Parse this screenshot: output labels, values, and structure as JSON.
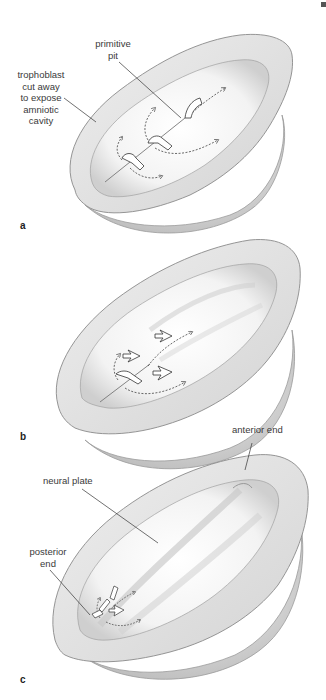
{
  "figure": {
    "panels": [
      {
        "id": "a",
        "label": "a",
        "annotations": [
          {
            "key": "trophoblast",
            "lines": [
              "trophoblast",
              "cut away",
              "to expose",
              "amniotic",
              "cavity"
            ]
          },
          {
            "key": "primitive_pit",
            "lines": [
              "primitive",
              "pit"
            ]
          }
        ]
      },
      {
        "id": "b",
        "label": "b",
        "annotations": []
      },
      {
        "id": "c",
        "label": "c",
        "annotations": [
          {
            "key": "anterior_end",
            "lines": [
              "anterior end"
            ]
          },
          {
            "key": "neural_plate",
            "lines": [
              "neural plate"
            ]
          },
          {
            "key": "posterior_end",
            "lines": [
              "posterior",
              "end"
            ]
          }
        ]
      }
    ]
  },
  "labels": {
    "a": {
      "panel": "a",
      "trophoblast_1": "trophoblast",
      "trophoblast_2": "cut away",
      "trophoblast_3": "to expose",
      "trophoblast_4": "amniotic",
      "trophoblast_5": "cavity",
      "primitive_pit_1": "primitive",
      "primitive_pit_2": "pit"
    },
    "b": {
      "panel": "b"
    },
    "c": {
      "panel": "c",
      "anterior_end": "anterior end",
      "neural_plate": "neural plate",
      "posterior_end_1": "posterior",
      "posterior_end_2": "end"
    }
  },
  "colors": {
    "outline": "#8a8a8a",
    "shade": "#c8c8c8",
    "leader": "#333333",
    "arrow": "#444444"
  }
}
